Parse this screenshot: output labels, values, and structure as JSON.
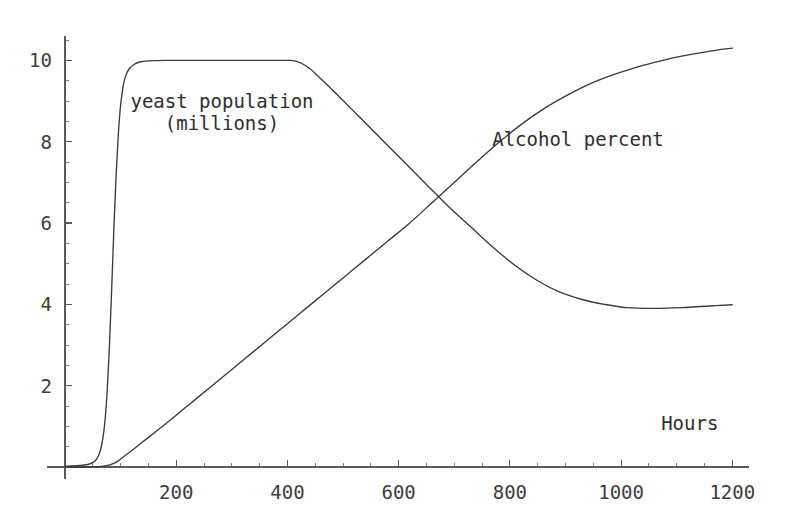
{
  "chart_data": {
    "type": "line",
    "title": "",
    "subtitle": "",
    "xlabel": "Hours",
    "ylabel": "",
    "xlim": [
      0,
      1230
    ],
    "ylim": [
      0,
      10.6
    ],
    "grid": false,
    "legend_position": "inline-annotations",
    "x_ticks": [
      {
        "value": 200,
        "label": "200"
      },
      {
        "value": 400,
        "label": "400"
      },
      {
        "value": 600,
        "label": "600"
      },
      {
        "value": 800,
        "label": "800"
      },
      {
        "value": 1000,
        "label": "1000"
      },
      {
        "value": 1200,
        "label": "1200"
      }
    ],
    "y_ticks": [
      {
        "value": 2,
        "label": "2"
      },
      {
        "value": 4,
        "label": "4"
      },
      {
        "value": 6,
        "label": "6"
      },
      {
        "value": 8,
        "label": "8"
      },
      {
        "value": 10,
        "label": "10"
      }
    ],
    "x_minor_step": 50,
    "y_minor_step": 0.5,
    "series": [
      {
        "name": "yeast population (millions)",
        "label_lines": [
          "yeast population",
          "(millions)"
        ],
        "label_x": 222,
        "label_y": 90,
        "color": "#3a3a3a",
        "points": [
          [
            0,
            0.02
          ],
          [
            20,
            0.03
          ],
          [
            35,
            0.05
          ],
          [
            45,
            0.08
          ],
          [
            52,
            0.13
          ],
          [
            58,
            0.22
          ],
          [
            63,
            0.38
          ],
          [
            68,
            0.7
          ],
          [
            72,
            1.15
          ],
          [
            76,
            1.9
          ],
          [
            80,
            3.0
          ],
          [
            84,
            4.4
          ],
          [
            88,
            5.9
          ],
          [
            92,
            7.2
          ],
          [
            96,
            8.2
          ],
          [
            100,
            8.9
          ],
          [
            105,
            9.4
          ],
          [
            110,
            9.65
          ],
          [
            116,
            9.8
          ],
          [
            124,
            9.9
          ],
          [
            134,
            9.96
          ],
          [
            150,
            9.99
          ],
          [
            180,
            10.0
          ],
          [
            240,
            10.0
          ],
          [
            300,
            10.0
          ],
          [
            360,
            10.0
          ],
          [
            400,
            10.0
          ],
          [
            413,
            9.99
          ],
          [
            425,
            9.93
          ],
          [
            440,
            9.8
          ],
          [
            460,
            9.55
          ],
          [
            490,
            9.15
          ],
          [
            530,
            8.6
          ],
          [
            570,
            8.05
          ],
          [
            610,
            7.5
          ],
          [
            650,
            6.95
          ],
          [
            690,
            6.4
          ],
          [
            730,
            5.9
          ],
          [
            770,
            5.4
          ],
          [
            810,
            4.95
          ],
          [
            850,
            4.58
          ],
          [
            890,
            4.3
          ],
          [
            930,
            4.12
          ],
          [
            970,
            4.0
          ],
          [
            1010,
            3.92
          ],
          [
            1060,
            3.9
          ],
          [
            1110,
            3.92
          ],
          [
            1160,
            3.96
          ],
          [
            1200,
            3.99
          ]
        ]
      },
      {
        "name": "Alcohol percent",
        "label_lines": [
          "Alcohol percent"
        ],
        "label_x": 578,
        "label_y": 128,
        "color": "#3a3a3a",
        "points": [
          [
            0,
            0.0
          ],
          [
            40,
            0.0
          ],
          [
            70,
            0.02
          ],
          [
            90,
            0.1
          ],
          [
            110,
            0.3
          ],
          [
            140,
            0.62
          ],
          [
            180,
            1.05
          ],
          [
            220,
            1.5
          ],
          [
            260,
            1.95
          ],
          [
            300,
            2.4
          ],
          [
            340,
            2.85
          ],
          [
            380,
            3.3
          ],
          [
            420,
            3.75
          ],
          [
            460,
            4.2
          ],
          [
            500,
            4.65
          ],
          [
            540,
            5.1
          ],
          [
            580,
            5.55
          ],
          [
            620,
            6.0
          ],
          [
            660,
            6.5
          ],
          [
            700,
            7.0
          ],
          [
            740,
            7.5
          ],
          [
            780,
            7.98
          ],
          [
            820,
            8.42
          ],
          [
            860,
            8.8
          ],
          [
            900,
            9.12
          ],
          [
            940,
            9.4
          ],
          [
            980,
            9.62
          ],
          [
            1020,
            9.8
          ],
          [
            1060,
            9.95
          ],
          [
            1100,
            10.08
          ],
          [
            1140,
            10.18
          ],
          [
            1180,
            10.27
          ],
          [
            1200,
            10.3
          ]
        ]
      }
    ],
    "annotations": [
      {
        "text": "Hours",
        "x": 1072,
        "y": 1.1,
        "name": "x-axis-label"
      }
    ]
  },
  "axes": {
    "x_axis_name": "hours-axis",
    "y_axis_name": "value-axis"
  }
}
